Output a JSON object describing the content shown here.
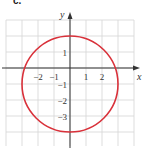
{
  "panel_label": "c.",
  "chart_data": {
    "type": "line",
    "title": "",
    "xlabel": "x",
    "ylabel": "y",
    "xlim": [
      -4,
      4
    ],
    "ylim": [
      -5,
      3
    ],
    "grid": true,
    "x_ticks": [
      {
        "value": -2,
        "label": "−2"
      },
      {
        "value": -1,
        "label": "−1"
      },
      {
        "value": 1,
        "label": "1"
      },
      {
        "value": 2,
        "label": "2"
      }
    ],
    "y_ticks": [
      {
        "value": 1,
        "label": "1"
      },
      {
        "value": -1,
        "label": "−1"
      },
      {
        "value": -2,
        "label": "−2"
      },
      {
        "value": -3,
        "label": "−3"
      }
    ],
    "series": [
      {
        "name": "circle",
        "shape": "circle",
        "center": [
          0,
          -1
        ],
        "radius": 3,
        "equation": "x^2 + (y+1)^2 = 9",
        "color": "#d9313a"
      }
    ]
  },
  "colors": {
    "grid": "#d4d4d4",
    "axis": "#333333",
    "curve": "#d9313a"
  }
}
